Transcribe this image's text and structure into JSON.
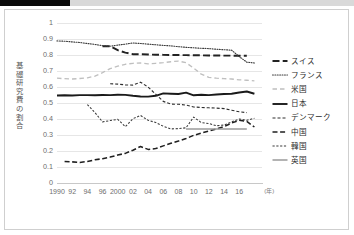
{
  "page": {
    "background": "#ffffff",
    "top_bar_color": "#d9d9d9",
    "top_bar_accent_color": "#0a0a0a",
    "frame_color": "#cfcfcf"
  },
  "axis": {
    "y_title": "基礎研究費の割合",
    "y_ticks": [
      "1",
      "0.9",
      "0.8",
      "0.7",
      "0.6",
      "0.5",
      "0.4",
      "0.3",
      "0.2",
      "0.1",
      "0"
    ],
    "x_ticks": [
      "1990",
      "92",
      "94",
      "96",
      "2000",
      "02",
      "04",
      "06",
      "08",
      "10",
      "12",
      "14",
      "16"
    ],
    "x_unit": "(年)"
  },
  "legend": {
    "items": [
      {
        "label": "スイス",
        "style": "long-dash",
        "color": "#222222",
        "width": 1.8
      },
      {
        "label": "フランス",
        "style": "dotted",
        "color": "#3b3b3b",
        "width": 1.2
      },
      {
        "label": "米国",
        "style": "dash-light",
        "color": "#bfbfbf",
        "width": 1.4
      },
      {
        "label": "日本",
        "style": "solid",
        "color": "#1a1a1a",
        "width": 2.0
      },
      {
        "label": "デンマーク",
        "style": "dash-med",
        "color": "#2e2e2e",
        "width": 1.2
      },
      {
        "label": "中国",
        "style": "dash-long",
        "color": "#1f1f1f",
        "width": 1.6
      },
      {
        "label": "韓国",
        "style": "dash-short",
        "color": "#3a3a3a",
        "width": 1.1
      },
      {
        "label": "英国",
        "style": "solid-gray",
        "color": "#9a9a9a",
        "width": 1.6
      }
    ]
  },
  "chart_data": {
    "type": "line",
    "title": "",
    "xlabel": "(年)",
    "ylabel": "基礎研究費の割合",
    "xlim": [
      1990,
      2017
    ],
    "ylim": [
      0,
      1
    ],
    "y_tick_step": 0.1,
    "grid": true,
    "legend_position": "right",
    "x": [
      1990,
      1991,
      1992,
      1993,
      1994,
      1995,
      1996,
      1997,
      1998,
      1999,
      2000,
      2001,
      2002,
      2003,
      2004,
      2005,
      2006,
      2007,
      2008,
      2009,
      2010,
      2011,
      2012,
      2013,
      2014,
      2015,
      2016
    ],
    "series": [
      {
        "name": "スイス",
        "style": "long-dash",
        "color": "#222222",
        "x": [
          1996,
          1997,
          1998,
          1999,
          2000,
          2001,
          2002,
          2003,
          2004,
          2005,
          2006,
          2007,
          2008,
          2009,
          2010,
          2011,
          2012,
          2013,
          2014,
          2015
        ],
        "values": [
          0.855,
          0.855,
          0.83,
          0.815,
          0.805,
          0.805,
          0.803,
          0.802,
          0.801,
          0.8,
          0.8,
          0.799,
          0.798,
          0.798,
          0.797,
          0.797,
          0.796,
          0.796,
          0.795,
          0.795
        ]
      },
      {
        "name": "フランス",
        "style": "dotted",
        "color": "#3b3b3b",
        "x": [
          1990,
          1991,
          1992,
          1993,
          1994,
          1995,
          1996,
          1997,
          1998,
          1999,
          2000,
          2001,
          2002,
          2003,
          2004,
          2005,
          2006,
          2007,
          2008,
          2009,
          2010,
          2011,
          2012,
          2013,
          2014,
          2015,
          2016
        ],
        "values": [
          0.888,
          0.886,
          0.882,
          0.878,
          0.872,
          0.866,
          0.858,
          0.855,
          0.862,
          0.868,
          0.875,
          0.872,
          0.868,
          0.864,
          0.86,
          0.857,
          0.852,
          0.848,
          0.845,
          0.842,
          0.84,
          0.836,
          0.833,
          0.83,
          0.79,
          0.755,
          0.75
        ]
      },
      {
        "name": "米国",
        "style": "dash-light",
        "color": "#bfbfbf",
        "x": [
          1990,
          1991,
          1992,
          1993,
          1994,
          1995,
          1996,
          1997,
          1998,
          1999,
          2000,
          2001,
          2002,
          2003,
          2004,
          2005,
          2006,
          2007,
          2008,
          2009,
          2010,
          2011,
          2012,
          2013,
          2014,
          2015,
          2016
        ],
        "values": [
          0.655,
          0.652,
          0.65,
          0.653,
          0.657,
          0.668,
          0.69,
          0.715,
          0.73,
          0.742,
          0.748,
          0.75,
          0.745,
          0.748,
          0.752,
          0.758,
          0.762,
          0.752,
          0.718,
          0.68,
          0.66,
          0.655,
          0.652,
          0.65,
          0.645,
          0.642,
          0.638
        ]
      },
      {
        "name": "日本",
        "style": "solid",
        "color": "#1a1a1a",
        "x": [
          1990,
          1991,
          1992,
          1993,
          1994,
          1995,
          1996,
          1997,
          1998,
          1999,
          2000,
          2001,
          2002,
          2003,
          2004,
          2005,
          2006,
          2007,
          2008,
          2009,
          2010,
          2011,
          2012,
          2013,
          2014,
          2015,
          2016
        ],
        "values": [
          0.547,
          0.548,
          0.547,
          0.549,
          0.549,
          0.548,
          0.55,
          0.549,
          0.552,
          0.551,
          0.545,
          0.541,
          0.54,
          0.545,
          0.56,
          0.558,
          0.556,
          0.565,
          0.548,
          0.552,
          0.549,
          0.553,
          0.556,
          0.558,
          0.566,
          0.572,
          0.558
        ]
      },
      {
        "name": "デンマーク",
        "style": "dash-med",
        "color": "#2e2e2e",
        "x": [
          1997,
          1998,
          1999,
          2000,
          2001,
          2002,
          2003,
          2004,
          2005,
          2006,
          2007,
          2008,
          2009,
          2010,
          2011,
          2012,
          2013,
          2014,
          2015
        ],
        "values": [
          0.62,
          0.618,
          0.613,
          0.612,
          0.63,
          0.6,
          0.555,
          0.51,
          0.493,
          0.492,
          0.487,
          0.475,
          0.472,
          0.47,
          0.468,
          0.465,
          0.455,
          0.445,
          0.44
        ]
      },
      {
        "name": "中国",
        "style": "dash-long",
        "color": "#1f1f1f",
        "x": [
          1991,
          1992,
          1993,
          1994,
          1995,
          1996,
          1997,
          1998,
          1999,
          2000,
          2001,
          2002,
          2003,
          2004,
          2005,
          2006,
          2007,
          2008,
          2009,
          2010,
          2011,
          2012,
          2013,
          2014,
          2015,
          2016
        ],
        "values": [
          0.135,
          0.132,
          0.128,
          0.135,
          0.145,
          0.152,
          0.162,
          0.175,
          0.185,
          0.205,
          0.228,
          0.21,
          0.215,
          0.232,
          0.248,
          0.262,
          0.278,
          0.298,
          0.312,
          0.325,
          0.338,
          0.352,
          0.375,
          0.392,
          0.385,
          0.35
        ]
      },
      {
        "name": "韓国",
        "style": "dash-short",
        "color": "#3a3a3a",
        "x": [
          1994,
          1995,
          1996,
          1997,
          1998,
          1999,
          2000,
          2001,
          2002,
          2003,
          2004,
          2005,
          2006,
          2007,
          2008,
          2009,
          2010,
          2011,
          2012,
          2013,
          2014,
          2015,
          2016
        ],
        "values": [
          0.49,
          0.44,
          0.382,
          0.39,
          0.398,
          0.352,
          0.402,
          0.422,
          0.392,
          0.378,
          0.355,
          0.338,
          0.34,
          0.345,
          0.412,
          0.378,
          0.372,
          0.358,
          0.362,
          0.382,
          0.4,
          0.392,
          0.405
        ]
      },
      {
        "name": "英国",
        "style": "solid-gray",
        "color": "#9a9a9a",
        "x": [
          2007,
          2015
        ],
        "values": [
          0.337,
          0.337
        ]
      }
    ]
  }
}
